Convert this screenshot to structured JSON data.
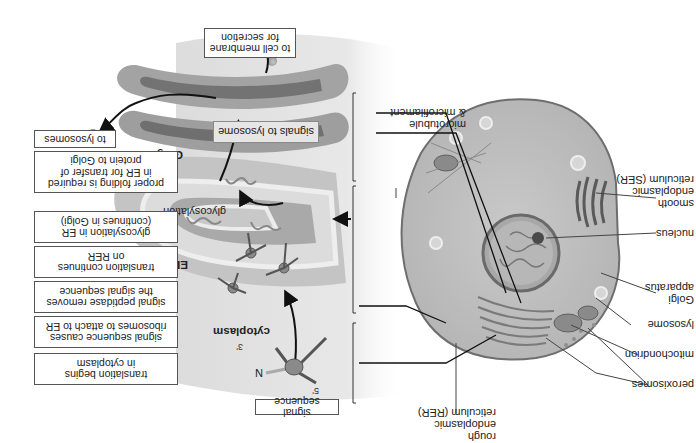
{
  "figure": {
    "orientation": "rotated 180 degrees",
    "cell_labels": {
      "smooth_er": "smooth\nendoplasmic\nreticulum (SER)",
      "nucleus": "nucleus",
      "golgi_apparatus": "Golgi\napparatus",
      "lysosome": "lysosome",
      "mitochondrion": "mitochondrion",
      "peroxisomes": "peroxisomes",
      "rough_er": "rough\nendoplasmic\nreticulum (RER)",
      "cytoskeleton": "microtubule\n& microfilament"
    },
    "region_labels": {
      "cytoplasm": "cytoplasm",
      "er_lumen": "ER lumen",
      "golgi": "Golgi",
      "glycosylation": "glycosylation"
    },
    "strand_labels": {
      "five_prime": "5'",
      "three_prime": "3'",
      "n_terminus": "N"
    },
    "callouts": {
      "signal_sequence": "signal sequence",
      "signals_to_lysosome": "signals to lysosome",
      "to_cell_membrane": "to cell membrane\nfor secretion"
    },
    "steps": [
      "translation begins\nin cytoplasm",
      "signal sequence causes\nribosomes to attach to ER",
      "signal peptidase removes\nthe signal sequence",
      "translation continues\non RER",
      "glycosylation in ER\n(continues in Golgi)",
      "proper folding is required\nin ER for transfer of\nprotein to Golgi",
      "to lysosomes"
    ],
    "colors": {
      "cell_fill": "#bdbdbd",
      "cell_outline": "#6e6e6e",
      "golgi_outer": "#9c9c9c",
      "golgi_inner": "#6f6f6f",
      "er_lumen_fill": "#a9a9a9",
      "er_membrane": "#dcdcdc",
      "vesicle": "#9e9e9e",
      "panel_gradient": "#e4e4e4",
      "line": "#222222"
    }
  }
}
